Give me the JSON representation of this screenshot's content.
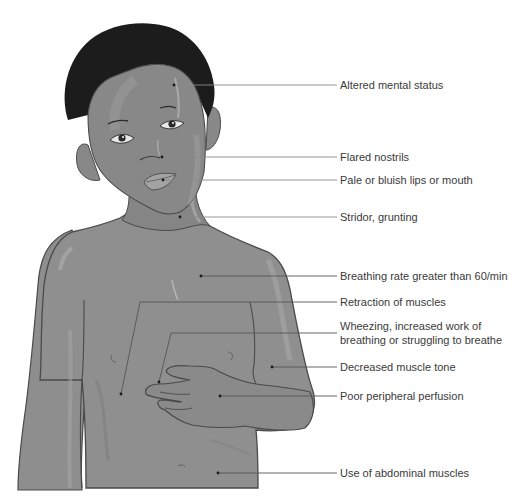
{
  "diagram": {
    "colors": {
      "skin": "#8d8d8d",
      "skin_light": "#a3a3a3",
      "skin_shadow": "#7a7a7a",
      "hair": "#1c1c1c",
      "outline": "#4a4a4a",
      "leader_line": "#8a8a8a",
      "text": "#3a3a3a"
    },
    "labels": [
      {
        "id": "altered-mental-status",
        "text": "Altered mental status",
        "y": 85,
        "dot": [
          174,
          85
        ]
      },
      {
        "id": "flared-nostrils",
        "text": "Flared nostrils",
        "y": 157,
        "dot": [
          162,
          157
        ]
      },
      {
        "id": "pale-lips",
        "text": "Pale or bluish lips or mouth",
        "y": 180,
        "dot": [
          163,
          180
        ]
      },
      {
        "id": "stridor-grunting",
        "text": "Stridor, grunting",
        "y": 217,
        "dot": [
          180,
          217
        ]
      },
      {
        "id": "breathing-rate",
        "text": "Breathing rate greater than 60/min",
        "y": 276,
        "dot": [
          201,
          276
        ]
      },
      {
        "id": "retraction-of-muscles",
        "text": "Retraction of muscles",
        "y": 302,
        "dot": [
          121,
          394
        ]
      },
      {
        "id": "wheezing",
        "text_line1": "Wheezing, increased work of",
        "text_line2": "breathing or struggling to breathe",
        "y": 333,
        "dot": [
          159,
          382
        ]
      },
      {
        "id": "decreased-muscle-tone",
        "text": "Decreased muscle tone",
        "y": 367,
        "dot": [
          272,
          367
        ]
      },
      {
        "id": "poor-peripheral-perfusion",
        "text": "Poor peripheral perfusion",
        "y": 396,
        "dot": [
          220,
          396
        ]
      },
      {
        "id": "abdominal-muscles",
        "text": "Use of abdominal muscles",
        "y": 473,
        "dot": [
          218,
          473
        ]
      }
    ]
  }
}
